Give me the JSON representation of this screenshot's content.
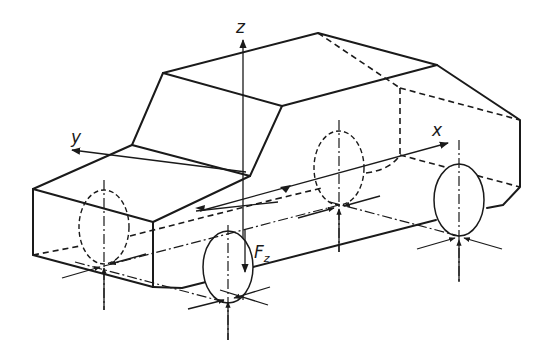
{
  "diagram": {
    "axes": {
      "x_label": "x",
      "y_label": "y",
      "z_label": "z"
    },
    "force": {
      "symbol": "F",
      "subscript": "z"
    },
    "wheels": [
      {
        "id": "front-left",
        "visibility": "hidden"
      },
      {
        "id": "front-right",
        "visibility": "visible"
      },
      {
        "id": "rear-left",
        "visibility": "hidden"
      },
      {
        "id": "rear-right",
        "visibility": "visible"
      }
    ],
    "colors": {
      "line": "#1a1a1a",
      "background": "#ffffff"
    }
  }
}
